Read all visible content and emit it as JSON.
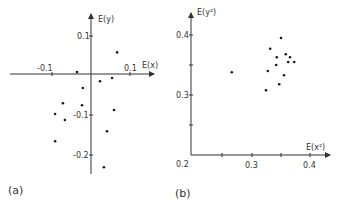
{
  "figure": {
    "panels": [
      {
        "id": "a",
        "label": "(a)"
      },
      {
        "id": "b",
        "label": "(b)"
      }
    ]
  },
  "chart_data": [
    {
      "type": "scatter",
      "panel_label": "(a)",
      "title": "",
      "xlabel": "E(x)",
      "ylabel": "E(y)",
      "x_ticks": [
        -0.1,
        0.1
      ],
      "x_tick_labels": [
        "-0.1",
        "0.1"
      ],
      "y_ticks": [
        0.1,
        -0.1,
        -0.2
      ],
      "y_tick_labels": [
        "0.1",
        "-0.1",
        "-0.2"
      ],
      "xlim": [
        -0.21,
        0.16
      ],
      "ylim": [
        -0.26,
        0.16
      ],
      "axes_through_origin": true,
      "grid": false,
      "x": [
        0.067,
        -0.036,
        0.023,
        0.054,
        -0.021,
        -0.072,
        -0.023,
        -0.092,
        -0.067,
        0.059,
        0.041,
        -0.092,
        0.033
      ],
      "y": [
        0.056,
        0.005,
        -0.018,
        -0.01,
        -0.035,
        -0.073,
        -0.078,
        -0.1,
        -0.115,
        -0.09,
        -0.143,
        -0.168,
        -0.233
      ]
    },
    {
      "type": "scatter",
      "panel_label": "(b)",
      "title": "",
      "xlabel": "E(x²)",
      "ylabel": "E(y²)",
      "x_ticks": [
        0.2,
        0.25,
        0.3,
        0.35,
        0.4
      ],
      "x_tick_labels": [
        "0.2",
        "",
        "0.3",
        "",
        "0.4"
      ],
      "y_ticks": [
        0.2,
        0.25,
        0.3,
        0.35,
        0.4
      ],
      "y_tick_labels": [
        "0.2",
        "",
        "0.3",
        "",
        "0.4"
      ],
      "xlim": [
        0.2,
        0.43
      ],
      "ylim": [
        0.2,
        0.43
      ],
      "grid": false,
      "x": [
        0.35,
        0.332,
        0.358,
        0.343,
        0.365,
        0.362,
        0.372,
        0.342,
        0.268,
        0.328,
        0.355,
        0.347,
        0.325
      ],
      "y": [
        0.395,
        0.377,
        0.368,
        0.363,
        0.363,
        0.355,
        0.355,
        0.35,
        0.338,
        0.34,
        0.333,
        0.318,
        0.308
      ]
    }
  ]
}
